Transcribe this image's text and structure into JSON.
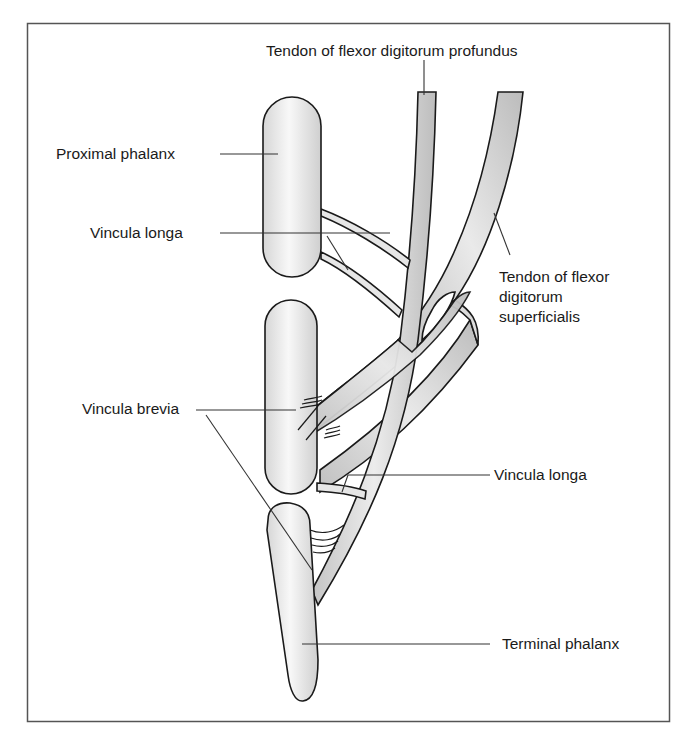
{
  "figure": {
    "frame": {
      "x": 27,
      "y": 23,
      "width": 642,
      "height": 698
    }
  },
  "labels": {
    "fdp_tendon": "Tendon of flexor digitorum profundus",
    "proximal_phalanx": "Proximal phalanx",
    "vincula_longa_upper": "Vincula longa",
    "fds_tendon_line1": "Tendon of flexor",
    "fds_tendon_line2": "digitorum",
    "fds_tendon_line3": "superficialis",
    "vincula_brevia": "Vincula brevia",
    "vincula_longa_lower": "Vincula longa",
    "terminal_phalanx": "Terminal phalanx"
  },
  "structures": [
    {
      "name": "Proximal phalanx",
      "type": "bone"
    },
    {
      "name": "Middle phalanx",
      "type": "bone"
    },
    {
      "name": "Terminal phalanx",
      "type": "bone"
    },
    {
      "name": "Tendon of flexor digitorum profundus",
      "type": "tendon"
    },
    {
      "name": "Tendon of flexor digitorum superficialis",
      "type": "tendon"
    },
    {
      "name": "Vincula longa",
      "type": "vinculum"
    },
    {
      "name": "Vincula brevia",
      "type": "vinculum"
    }
  ],
  "colors": {
    "bone_fill": "#e4e4e4",
    "bone_highlight": "#f7f7f7",
    "tendon_fill": "#d2d2d2",
    "tendon_highlight": "#ededed",
    "outline": "#1a1a1a",
    "frame": "#555555"
  }
}
